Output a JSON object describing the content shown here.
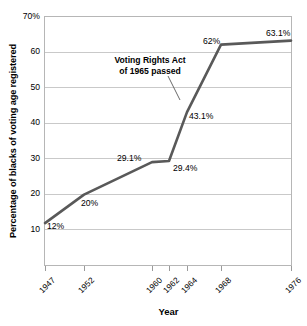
{
  "chart_data": {
    "type": "line",
    "title": "",
    "xlabel": "Year",
    "ylabel": "Percentage of blacks of voting age registered",
    "x": [
      1947,
      1952,
      1960,
      1962,
      1964,
      1968,
      1976
    ],
    "x_tick_labels": [
      "1947",
      "1952",
      "1960",
      "1962",
      "1964",
      "1968",
      "1976"
    ],
    "values": [
      12,
      20,
      29.1,
      29.4,
      43.1,
      62,
      63.1
    ],
    "point_labels": [
      "12%",
      "20%",
      "29.1%",
      "29.4%",
      "43.1%",
      "62%",
      "63.1%"
    ],
    "y_tick_labels": [
      "70%",
      "60",
      "50",
      "40",
      "30",
      "20",
      "10"
    ],
    "y_tick_values": [
      70,
      60,
      50,
      40,
      30,
      20,
      10
    ],
    "ylim": [
      0,
      70
    ],
    "xlim": [
      1947,
      1976
    ],
    "grid": true,
    "legend": "none",
    "line_color": "#595959",
    "grid_color": "#c9c9c9",
    "frame_color": "#b6b6b6",
    "annotations": [
      {
        "line1": "Voting Rights Act",
        "line2": "of 1965 passed"
      }
    ]
  },
  "axis": {
    "y_title": "Percentage of blacks of voting age registered",
    "x_title": "Year"
  }
}
